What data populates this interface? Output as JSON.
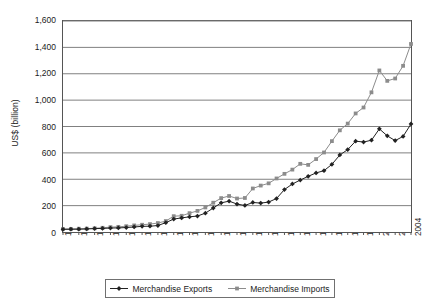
{
  "chart_data": {
    "type": "line",
    "title": "",
    "xlabel": "",
    "ylabel": "US$ (billion)",
    "ylim": [
      0,
      1600
    ],
    "ytick_step": 200,
    "ytick_labels": [
      "0",
      "200",
      "400",
      "600",
      "800",
      "1,000",
      "1,200",
      "1,400",
      "1,600"
    ],
    "ytick_values": [
      0,
      200,
      400,
      600,
      800,
      1000,
      1200,
      1400,
      1600
    ],
    "grid": "horizontal",
    "legend_position": "bottom",
    "xlim": [
      1960,
      2004
    ],
    "xtick_label_step": 2,
    "xtick_labels": [
      "1960",
      "1962",
      "1964",
      "1966",
      "1968",
      "1970",
      "1972",
      "1974",
      "1976",
      "1978",
      "1980",
      "1982",
      "1984",
      "1986",
      "1988",
      "1990",
      "1992",
      "1994",
      "1996",
      "1998",
      "2000",
      "2002",
      "2004"
    ],
    "x": [
      1960,
      1961,
      1962,
      1963,
      1964,
      1965,
      1966,
      1967,
      1968,
      1969,
      1970,
      1971,
      1972,
      1973,
      1974,
      1975,
      1976,
      1977,
      1978,
      1979,
      1980,
      1981,
      1982,
      1983,
      1984,
      1985,
      1986,
      1987,
      1988,
      1989,
      1990,
      1991,
      1992,
      1993,
      1994,
      1995,
      1996,
      1997,
      1998,
      1999,
      2000,
      2001,
      2002,
      2003,
      2004
    ],
    "series": [
      {
        "name": "Merchandise Exports",
        "color": "#222222",
        "marker": "diamond",
        "values": [
          20,
          21,
          21,
          23,
          26,
          27,
          30,
          31,
          34,
          38,
          43,
          44,
          49,
          71,
          98,
          107,
          115,
          121,
          143,
          182,
          221,
          234,
          212,
          201,
          224,
          219,
          227,
          254,
          322,
          364,
          394,
          422,
          448,
          465,
          513,
          584,
          625,
          689,
          682,
          696,
          782,
          729,
          693,
          725,
          819
        ]
      },
      {
        "name": "Merchandise Imports",
        "color": "#8c8c8c",
        "marker": "square",
        "values": [
          23,
          23,
          25,
          26,
          28,
          32,
          37,
          39,
          44,
          50,
          55,
          60,
          68,
          83,
          120,
          123,
          143,
          160,
          186,
          222,
          257,
          273,
          254,
          258,
          330,
          352,
          369,
          406,
          441,
          473,
          517,
          509,
          553,
          603,
          689,
          771,
          822,
          899,
          944,
          1059,
          1225,
          1146,
          1164,
          1260,
          1426
        ]
      }
    ],
    "notes": {
      "imports_peak_2000": 1225,
      "imports_2004": 1426,
      "exports_peak_2000": 782,
      "exports_2004": 819
    }
  },
  "legend": {
    "entries": [
      {
        "label": "Merchandise Exports"
      },
      {
        "label": "Merchandise Imports"
      }
    ]
  }
}
